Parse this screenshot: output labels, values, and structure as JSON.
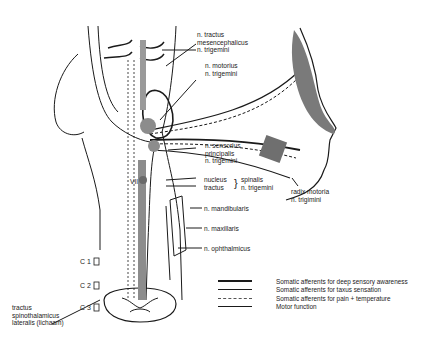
{
  "figure": {
    "colors": {
      "line": "#1a1a1a",
      "shade": "#7a7a7a",
      "tract": "#8c8c8c",
      "background": "#ffffff"
    }
  },
  "labels": {
    "mesencephalicus": [
      "n. tractus",
      "mesencephalicus",
      "n. trigemini"
    ],
    "motorius": [
      "n. motorius",
      "n. trigemini"
    ],
    "sensorius": [
      "n. sensorius",
      "principalis",
      "n. trigemini"
    ],
    "nucleus": "nucleus",
    "tractus": "tractus",
    "spinalis": [
      "spinalis",
      "n. trigemini"
    ],
    "vii": "VII",
    "radix": [
      "radix motoria",
      "n. trigimini"
    ],
    "mandibularis": "n. mandibularis",
    "maxillaris": "n. maxillaris",
    "ophthalmicus": "n. ophthalmicus",
    "c1": "C 1",
    "c2": "C 2",
    "c3": "C 3",
    "spinothalamicus": [
      "tractus",
      "spinothalamicus",
      "lateralis (lichaam)"
    ]
  },
  "legend": [
    {
      "style": "thick",
      "label": "Somatic afferents for deep sensory awareness"
    },
    {
      "style": "medium",
      "label": "Somatic afferents for taxus sensation"
    },
    {
      "style": "dashed",
      "label": "Somatic afferents for pain + temperature"
    },
    {
      "style": "thin",
      "label": "Motor function"
    }
  ]
}
